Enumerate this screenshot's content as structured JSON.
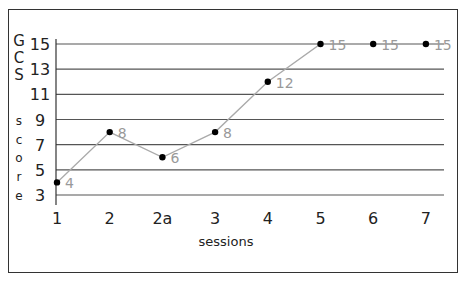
{
  "chart_data": {
    "type": "line",
    "title": "",
    "xlabel": "sessions",
    "ylabel": "GCS score",
    "ylabel_letters": [
      "G",
      "C",
      "S",
      "",
      "s",
      "c",
      "o",
      "r",
      "e"
    ],
    "categories": [
      "1",
      "2",
      "2a",
      "3",
      "4",
      "5",
      "6",
      "7"
    ],
    "series": [
      {
        "name": "GCS score",
        "values": [
          4,
          8,
          6,
          8,
          12,
          15,
          15,
          15
        ]
      }
    ],
    "y_ticks": [
      15,
      13,
      11,
      9,
      7,
      5,
      3
    ],
    "ylim": [
      3,
      15
    ],
    "grid": true,
    "legend": "none",
    "colors": {
      "line": "#aaaaaa",
      "marker": "#000000",
      "label": "#999999",
      "grid": "#555555"
    }
  }
}
